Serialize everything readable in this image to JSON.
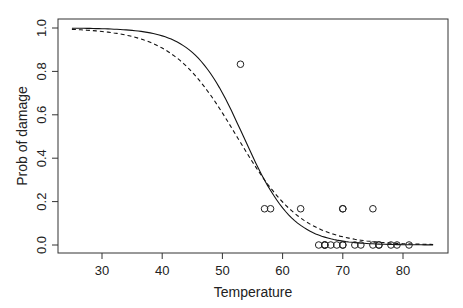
{
  "chart_data": {
    "type": "scatter",
    "title": "",
    "xlabel": "Temperature",
    "ylabel": "Prob of damage",
    "xlim": [
      23,
      88
    ],
    "ylim": [
      -0.03,
      1.04
    ],
    "xticks": [
      30,
      40,
      50,
      60,
      70,
      80
    ],
    "yticks": [
      0.0,
      0.2,
      0.4,
      0.6,
      0.8,
      1.0
    ],
    "ytick_labels": [
      "0.0",
      "0.2",
      "0.4",
      "0.6",
      "0.8",
      "1.0"
    ],
    "grid": false,
    "legend": null,
    "points": {
      "name": "observed proportion damaged",
      "marker": "open-circle",
      "x": [
        53,
        57,
        58,
        63,
        66,
        67,
        67,
        67,
        68,
        69,
        70,
        70,
        70,
        70,
        72,
        73,
        75,
        75,
        76,
        76,
        78,
        79,
        81
      ],
      "y": [
        0.833,
        0.167,
        0.167,
        0.167,
        0,
        0,
        0,
        0,
        0,
        0,
        0,
        0,
        0.167,
        0.167,
        0,
        0,
        0.167,
        0,
        0,
        0,
        0,
        0,
        0
      ]
    },
    "series": [
      {
        "name": "fitted logistic (solid)",
        "style": "solid",
        "x_range": [
          25,
          85
        ],
        "center": 53.5,
        "slope": -0.243
      },
      {
        "name": "fitted logistic (dashed)",
        "style": "dashed",
        "x_range": [
          25,
          85
        ],
        "center": 52.4,
        "slope": -0.184
      }
    ]
  }
}
